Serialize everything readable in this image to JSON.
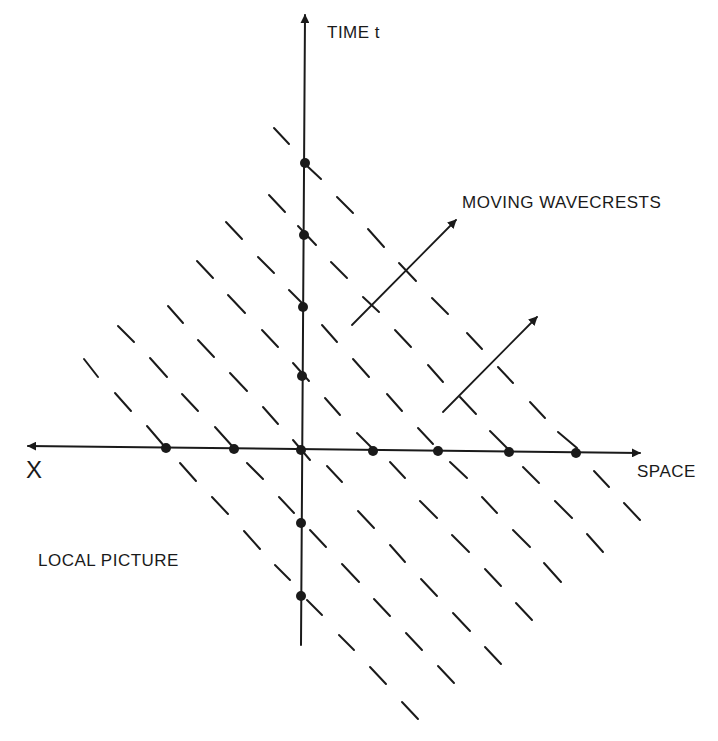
{
  "diagram": {
    "labels": {
      "time_axis": "TIME t",
      "moving_wavecrests": "MOVING WAVECRESTS",
      "x_axis_left": "X",
      "space_axis": "SPACE",
      "local_picture": "LOCAL PICTURE"
    },
    "colors": {
      "ink": "#1a1a1a",
      "background": "#ffffff"
    },
    "axes": {
      "horizontal": {
        "x1": 28,
        "y1": 446,
        "x2": 640,
        "y2": 453,
        "arrow_both_ends": true
      },
      "vertical": {
        "x1": 301,
        "y1": 645,
        "x2": 305,
        "y2": 15,
        "arrow_top": true
      }
    },
    "space_axis_dots": [
      [
        166,
        448
      ],
      [
        234,
        449
      ],
      [
        301,
        450
      ],
      [
        373,
        451
      ],
      [
        438,
        451
      ],
      [
        509,
        452
      ],
      [
        576,
        453
      ]
    ],
    "time_axis_dots": [
      [
        305,
        163
      ],
      [
        304,
        235
      ],
      [
        303,
        307
      ],
      [
        302,
        376
      ],
      [
        301,
        523
      ],
      [
        301,
        596
      ]
    ],
    "wavecrest_dashes": [
      [
        274,
        128,
        289,
        144
      ],
      [
        306,
        165,
        321,
        179
      ],
      [
        269,
        195,
        285,
        212
      ],
      [
        337,
        197,
        353,
        213
      ],
      [
        226,
        222,
        242,
        239
      ],
      [
        298,
        226,
        316,
        245
      ],
      [
        368,
        229,
        384,
        247
      ],
      [
        197,
        261,
        213,
        278
      ],
      [
        258,
        257,
        274,
        273
      ],
      [
        331,
        262,
        347,
        278
      ],
      [
        399,
        263,
        416,
        281
      ],
      [
        168,
        306,
        183,
        323
      ],
      [
        228,
        295,
        245,
        313
      ],
      [
        289,
        290,
        305,
        306
      ],
      [
        363,
        297,
        379,
        312
      ],
      [
        432,
        298,
        448,
        314
      ],
      [
        118,
        326,
        134,
        342
      ],
      [
        198,
        340,
        214,
        357
      ],
      [
        262,
        330,
        278,
        347
      ],
      [
        322,
        325,
        337,
        342
      ],
      [
        395,
        330,
        411,
        347
      ],
      [
        467,
        333,
        482,
        349
      ],
      [
        84,
        359,
        98,
        377
      ],
      [
        150,
        358,
        167,
        377
      ],
      [
        230,
        373,
        247,
        391
      ],
      [
        293,
        363,
        309,
        381
      ],
      [
        353,
        359,
        369,
        377
      ],
      [
        428,
        365,
        443,
        382
      ],
      [
        498,
        367,
        513,
        383
      ],
      [
        115,
        393,
        131,
        411
      ],
      [
        182,
        394,
        198,
        411
      ],
      [
        263,
        407,
        278,
        424
      ],
      [
        325,
        398,
        340,
        415
      ],
      [
        387,
        394,
        402,
        411
      ],
      [
        460,
        397,
        476,
        414
      ],
      [
        530,
        402,
        545,
        418
      ],
      [
        147,
        426,
        165,
        447
      ],
      [
        215,
        427,
        233,
        447
      ],
      [
        293,
        440,
        310,
        460
      ],
      [
        357,
        433,
        372,
        448
      ],
      [
        418,
        428,
        433,
        444
      ],
      [
        490,
        431,
        507,
        448
      ],
      [
        558,
        432,
        577,
        448
      ],
      [
        180,
        463,
        196,
        481
      ],
      [
        247,
        463,
        263,
        479
      ],
      [
        327,
        466,
        342,
        482
      ],
      [
        390,
        462,
        405,
        478
      ],
      [
        450,
        462,
        467,
        478
      ],
      [
        523,
        467,
        539,
        483
      ],
      [
        594,
        471,
        609,
        487
      ],
      [
        212,
        497,
        228,
        514
      ],
      [
        279,
        497,
        294,
        513
      ],
      [
        358,
        511,
        374,
        528
      ],
      [
        420,
        501,
        437,
        518
      ],
      [
        482,
        497,
        497,
        513
      ],
      [
        555,
        501,
        572,
        518
      ],
      [
        624,
        503,
        640,
        520
      ],
      [
        244,
        531,
        260,
        549
      ],
      [
        310,
        530,
        326,
        547
      ],
      [
        390,
        545,
        405,
        562
      ],
      [
        452,
        535,
        469,
        552
      ],
      [
        513,
        530,
        530,
        547
      ],
      [
        587,
        534,
        603,
        552
      ],
      [
        275,
        565,
        290,
        580
      ],
      [
        342,
        564,
        359,
        582
      ],
      [
        421,
        579,
        437,
        596
      ],
      [
        485,
        569,
        501,
        586
      ],
      [
        544,
        563,
        561,
        582
      ],
      [
        307,
        600,
        322,
        615
      ],
      [
        374,
        599,
        390,
        616
      ],
      [
        453,
        613,
        470,
        631
      ],
      [
        516,
        603,
        532,
        620
      ],
      [
        339,
        635,
        354,
        650
      ],
      [
        406,
        633,
        422,
        650
      ],
      [
        485,
        647,
        501,
        664
      ],
      [
        370,
        667,
        386,
        684
      ],
      [
        438,
        666,
        454,
        683
      ],
      [
        402,
        702,
        418,
        719
      ]
    ],
    "arrows": [
      {
        "name": "wavecrest-motion-arrow-1",
        "x1": 352,
        "y1": 325,
        "x2": 456,
        "y2": 220
      },
      {
        "name": "wavecrest-motion-arrow-2",
        "x1": 443,
        "y1": 412,
        "x2": 537,
        "y2": 317
      }
    ]
  }
}
